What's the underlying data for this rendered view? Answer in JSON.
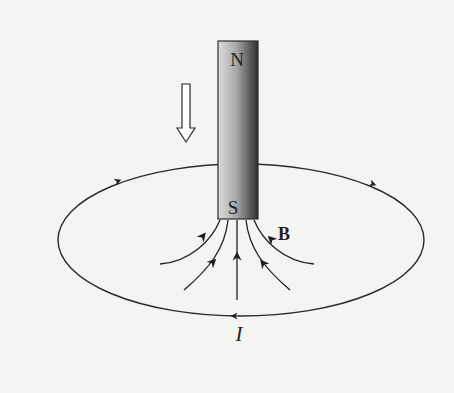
{
  "figure": {
    "magnet": {
      "north_label": "N",
      "south_label": "S",
      "gradient_light": "#d8d8d8",
      "gradient_dark": "#3a3a3a"
    },
    "motion_arrow": {
      "direction": "down",
      "style": "hollow"
    },
    "loop": {
      "current_label": "I",
      "current_direction": "counterclockwise-from-above"
    },
    "field": {
      "label": "B",
      "line_count": 5,
      "direction": "toward south pole (upward)"
    },
    "colors": {
      "background": "#f4f4f3",
      "ink": "#1f1f1f"
    }
  }
}
